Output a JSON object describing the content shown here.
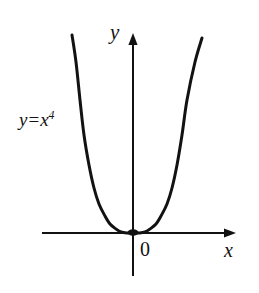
{
  "figure": {
    "background_color": "#ffffff",
    "ink_color": "#121212",
    "width": 259,
    "height": 293
  },
  "labels": {
    "curve_equation": {
      "lhs": "y",
      "operator": "=",
      "base": "x",
      "exponent": "4"
    },
    "y_axis": "y",
    "x_axis": "x",
    "origin": "0"
  },
  "chart_data": {
    "type": "line",
    "title": "",
    "subtitle": "",
    "xlabel": "x",
    "ylabel": "y",
    "legend": [],
    "legend_position": "none",
    "grid": false,
    "annotations": [
      {
        "text": "y = x^4",
        "x_px": 19,
        "y_px": 110
      },
      {
        "text": "0",
        "x_px": 140,
        "y_px": 239
      }
    ],
    "axes": {
      "origin_px": {
        "x": 133,
        "y": 233
      },
      "x_axis_px": {
        "x_start": 42,
        "x_end": 236,
        "y": 233,
        "arrow_end": "right"
      },
      "y_axis_px": {
        "y_start": 33,
        "y_end": 276,
        "x": 133,
        "arrow_end": "top"
      },
      "x_tick_labels": [],
      "y_tick_labels": [],
      "xlim": [
        -1.45,
        1.45
      ],
      "ylim": [
        -0.32,
        1.5
      ]
    },
    "series": [
      {
        "name": "y = x^4",
        "equation": "y = x**4",
        "color": "#121212",
        "line_width_px": 3,
        "x": [
          -1.18,
          -1.1,
          -1.0,
          -0.9,
          -0.8,
          -0.7,
          -0.6,
          -0.5,
          -0.4,
          -0.3,
          -0.2,
          -0.1,
          0.0,
          0.1,
          0.2,
          0.3,
          0.4,
          0.5,
          0.6,
          0.7,
          0.8,
          0.9,
          1.0,
          1.1,
          1.16
        ],
        "y": [
          1.939,
          1.464,
          1.0,
          0.656,
          0.41,
          0.24,
          0.13,
          0.063,
          0.026,
          0.008,
          0.0016,
          0.0001,
          0.0,
          0.0001,
          0.0016,
          0.008,
          0.026,
          0.063,
          0.13,
          0.24,
          0.41,
          0.656,
          1.0,
          1.464,
          1.811
        ],
        "points_px": [
          [
            72,
            35
          ],
          [
            76,
            62
          ],
          [
            80,
            100
          ],
          [
            84,
            135
          ],
          [
            89,
            165
          ],
          [
            94,
            188
          ],
          [
            99,
            204
          ],
          [
            105,
            216
          ],
          [
            110,
            224
          ],
          [
            116,
            229
          ],
          [
            121,
            232
          ],
          [
            127,
            233
          ],
          [
            133,
            233
          ],
          [
            139,
            233
          ],
          [
            145,
            232
          ],
          [
            150,
            229
          ],
          [
            156,
            224
          ],
          [
            161,
            216
          ],
          [
            167,
            204
          ],
          [
            172,
            188
          ],
          [
            177,
            165
          ],
          [
            182,
            135
          ],
          [
            187,
            100
          ],
          [
            195,
            62
          ],
          [
            202,
            38
          ]
        ]
      }
    ]
  }
}
